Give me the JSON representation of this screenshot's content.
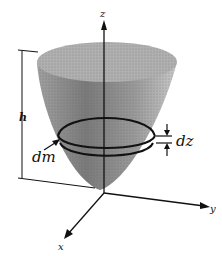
{
  "diagram": {
    "labels": {
      "z_axis": "z",
      "y_axis": "y",
      "x_axis": "x",
      "height": "h",
      "mass_element": "dm",
      "thickness": "dz"
    },
    "colors": {
      "surface": "#8a8a8a",
      "rim": "#b5b5b5",
      "ink": "#111111"
    }
  }
}
